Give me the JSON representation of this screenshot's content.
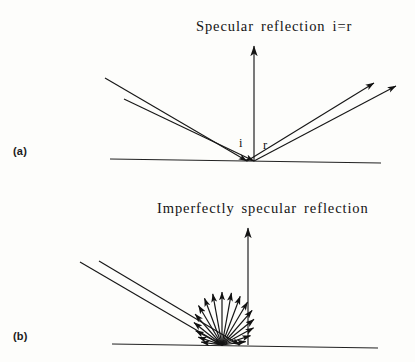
{
  "figure": {
    "width": 415,
    "height": 362,
    "background_color": "#fdfdfb",
    "ink_color": "#171717"
  },
  "panels": [
    {
      "id": "a",
      "label": "(a)",
      "title": "Specular reflection i=r",
      "angle_labels": {
        "incidence": "i",
        "reflection": "r"
      },
      "surface": {
        "x1": 110,
        "y1": 159,
        "x2": 381,
        "y2": 163
      },
      "normal": {
        "x": 254,
        "y_top": 46,
        "y_bottom": 161
      },
      "incident_rays": [
        {
          "x1": 105,
          "y1": 78,
          "x2": 247,
          "y2": 161
        },
        {
          "x1": 124,
          "y1": 99,
          "x2": 254,
          "y2": 161
        }
      ],
      "reflected_rays": [
        {
          "x1": 247,
          "y1": 161,
          "x2": 374,
          "y2": 83
        },
        {
          "x1": 254,
          "y1": 161,
          "x2": 396,
          "y2": 86
        }
      ]
    },
    {
      "id": "b",
      "label": "(b)",
      "title": "Imperfectly specular reflection",
      "surface": {
        "x1": 112,
        "y1": 344,
        "x2": 378,
        "y2": 348
      },
      "normal": {
        "x": 248,
        "y_top": 228,
        "y_bottom": 345
      },
      "incident_rays": [
        {
          "x1": 80,
          "y1": 262,
          "x2": 222,
          "y2": 345
        },
        {
          "x1": 99,
          "y1": 261,
          "x2": 240,
          "y2": 345
        }
      ],
      "fan": {
        "origin_x": 222,
        "origin_y": 345,
        "ray_count": 17,
        "angle_start_deg": 8,
        "angle_end_deg": 172,
        "lengths": [
          24,
          30,
          36,
          41,
          46,
          50,
          52,
          53,
          53,
          52,
          50,
          46,
          41,
          36,
          30,
          25,
          21
        ]
      }
    }
  ],
  "icons": {
    "arrowhead": "arrow-head-marker"
  }
}
